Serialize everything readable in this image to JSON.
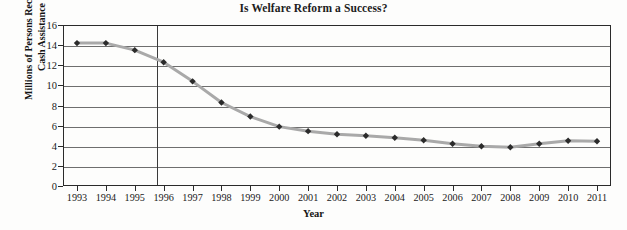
{
  "chart_data": {
    "type": "line",
    "title": "Is Welfare Reform a Success?",
    "xlabel": "Year",
    "ylabel_line1": "Millions of Persons Receiving",
    "ylabel_line2": "Cash Assistance",
    "ylabel": "Millions of Persons Receiving Cash Assistance",
    "categories": [
      1993,
      1994,
      1995,
      1996,
      1997,
      1998,
      1999,
      2000,
      2001,
      2002,
      2003,
      2004,
      2005,
      2006,
      2007,
      2008,
      2009,
      2010,
      2011
    ],
    "xtick_labels": [
      "1993",
      "1994",
      "1995",
      "1996",
      "1997",
      "1998",
      "1999",
      "2000",
      "2001",
      "2002",
      "2003",
      "2004",
      "2005",
      "2006",
      "2007",
      "2008",
      "2009",
      "2010",
      "2011"
    ],
    "values": [
      14.2,
      14.2,
      13.5,
      12.3,
      10.4,
      8.3,
      6.9,
      5.9,
      5.45,
      5.15,
      5.0,
      4.8,
      4.55,
      4.2,
      3.95,
      3.85,
      4.2,
      4.5,
      4.45
    ],
    "ylim": [
      0,
      16
    ],
    "ytick_labels": [
      "0",
      "2",
      "4",
      "6",
      "8",
      "10",
      "12",
      "14",
      "16"
    ],
    "yticks": [
      0,
      2,
      4,
      6,
      8,
      10,
      12,
      14,
      16
    ],
    "grid": "horizontal",
    "legend": "none",
    "annotations": [
      {
        "name": "welfare-reform-marker",
        "type": "vertical-reference-line",
        "x": 1995.75,
        "label": ""
      }
    ],
    "series_color": "#a9a9a9",
    "marker_color": "#2b2b2b",
    "marker_shape": "diamond",
    "gridline_color": "#6e6e6e",
    "axis_color": "#2a2a2a",
    "background_color": "#fdfdfc"
  }
}
